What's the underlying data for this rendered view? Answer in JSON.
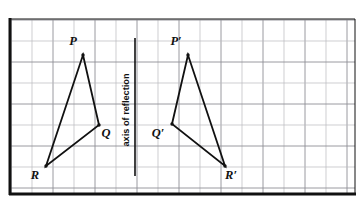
{
  "figure": {
    "background_color": "#ffffff",
    "ink_color": "#111111",
    "grid_color": "#b9b9bd",
    "grid_color_strong": "#8e8e95",
    "frame": {
      "left_border_x": 11,
      "top_border_y": 20,
      "right_border_x": 355,
      "bottom_border_y": 194,
      "left_border_width": 3,
      "bottom_border_width": 3,
      "thin_border_width": 1
    },
    "grid": {
      "cell_size": 21.0,
      "origin_x": 11,
      "origin_y": 20,
      "columns": 16,
      "rows": 8,
      "visible": true
    },
    "axis_of_reflection": {
      "label": "axis of reflection",
      "label_orientation": "vertical-bottom-to-top",
      "label_x": 129,
      "label_center_y": 110,
      "line_x": 135,
      "line_y_top": 38,
      "line_y_bottom": 176,
      "line_width": 1.6
    },
    "shapes": [
      {
        "name": "triangle-pqr",
        "stroke_width": 1.8,
        "closed": true,
        "vertices": [
          {
            "label": "P",
            "x": 83,
            "y": 55,
            "label_x": 73,
            "label_y": 45,
            "dot": true
          },
          {
            "label": "Q",
            "x": 99,
            "y": 125,
            "label_x": 106,
            "label_y": 137,
            "dot": true
          },
          {
            "label": "R",
            "x": 46,
            "y": 166,
            "label_x": 35,
            "label_y": 179,
            "dot": true
          }
        ]
      },
      {
        "name": "triangle-p-prime-q-prime-r-prime",
        "stroke_width": 1.8,
        "closed": true,
        "vertices": [
          {
            "label": "P′",
            "x": 188,
            "y": 55,
            "label_x": 176,
            "label_y": 45,
            "dot": true
          },
          {
            "label": "Q′",
            "x": 172,
            "y": 124,
            "label_x": 158,
            "label_y": 137,
            "dot": true
          },
          {
            "label": "R′",
            "x": 225,
            "y": 166,
            "label_x": 231,
            "label_y": 179,
            "dot": true
          }
        ]
      }
    ],
    "vertex_labels": {
      "p": "P",
      "q": "Q",
      "r": "R",
      "p_prime": "P′",
      "q_prime": "Q′",
      "r_prime": "R′"
    }
  },
  "chart_data": {
    "type": "scatter",
    "xlabel": "",
    "ylabel": "",
    "grid": true,
    "legend": null,
    "annotations": [
      "axis of reflection"
    ],
    "axis_of_reflection_x_grid": 5.9,
    "xlim": [
      0,
      16.4
    ],
    "ylim": [
      0,
      8.3
    ],
    "series": [
      {
        "name": "Triangle PQR",
        "point_labels": [
          "P",
          "Q",
          "R"
        ],
        "x": [
          3.43,
          4.19,
          1.67
        ],
        "y": [
          6.33,
          3.29,
          1.33
        ]
      },
      {
        "name": "Triangle P'Q'R'",
        "point_labels": [
          "P′",
          "Q′",
          "R′"
        ],
        "x": [
          8.43,
          7.67,
          10.19
        ],
        "y": [
          6.33,
          3.33,
          1.33
        ]
      }
    ]
  }
}
